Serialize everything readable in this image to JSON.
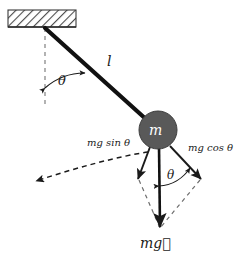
{
  "figure": {
    "labels": {
      "length": "l",
      "angle_pivot": "θ",
      "angle_bob": "θ",
      "bob_mass": "m",
      "tangential_force": "mg sin θ",
      "radial_force": "mg cos θ",
      "weight": "mg⃗"
    },
    "colors": {
      "bob_fill": "#595959",
      "bob_stroke": "#3d3d3d",
      "bob_text": "#ffffff",
      "rod": "#111111",
      "arrow": "#1a1a1a",
      "dashed": "#4d4d4d",
      "ceiling_hatch": "#4a4a4a",
      "background": "#ffffff"
    },
    "geometry": {
      "ceiling_rect": [
        8,
        10,
        68,
        17
      ],
      "pivot": [
        45,
        28
      ],
      "bob_center": [
        158,
        130
      ],
      "bob_radius": 19,
      "vertical_ref_end": [
        45,
        108
      ],
      "weight_arrow_tip": [
        160,
        228
      ],
      "mg_sin_arrow_tip": [
        139,
        180
      ],
      "mg_cos_arrow_tip": [
        200,
        180
      ],
      "trajectory_arrow_tip": [
        33,
        182
      ]
    }
  }
}
